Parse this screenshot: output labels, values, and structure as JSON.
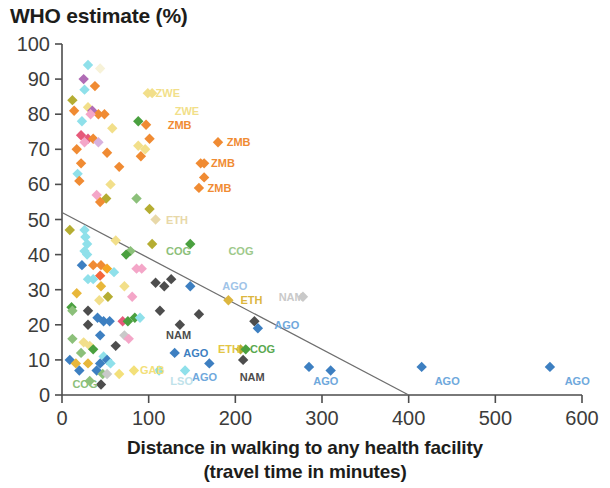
{
  "chart_data": {
    "type": "scatter",
    "title": "WHO estimate (%)",
    "ylabel": "WHO estimate (%)",
    "xlabel": "Distance in walking to any health facility",
    "xlabel_line2": "(travel time in minutes)",
    "xlim": [
      0,
      600
    ],
    "ylim": [
      0,
      100
    ],
    "xticks": [
      0,
      100,
      200,
      300,
      400,
      500,
      600
    ],
    "yticks": [
      0,
      10,
      20,
      30,
      40,
      50,
      60,
      70,
      80,
      90,
      100
    ],
    "grid": false,
    "legend": "none",
    "trendline": {
      "x0": 0,
      "y0": 52,
      "x1": 400,
      "y1": 0,
      "color": "#6e6e6e"
    },
    "annotations": [
      {
        "text": "ZWE",
        "x": 108,
        "y": 86,
        "color": "#f2df8a"
      },
      {
        "text": "ZWE",
        "x": 130,
        "y": 81,
        "color": "#f2df8a"
      },
      {
        "text": "ZMB",
        "x": 122,
        "y": 77,
        "color": "#f08b33"
      },
      {
        "text": "ZMB",
        "x": 190,
        "y": 72,
        "color": "#f08b33"
      },
      {
        "text": "ZMB",
        "x": 172,
        "y": 66,
        "color": "#f08b33"
      },
      {
        "text": "ZMB",
        "x": 168,
        "y": 59,
        "color": "#f08b33"
      },
      {
        "text": "ETH",
        "x": 120,
        "y": 50,
        "color": "#e8d8a8"
      },
      {
        "text": "COG",
        "x": 120,
        "y": 41,
        "color": "#8cc07a"
      },
      {
        "text": "COG",
        "x": 192,
        "y": 41,
        "color": "#9ec98b"
      },
      {
        "text": "AGO",
        "x": 185,
        "y": 31,
        "color": "#9fc4e8"
      },
      {
        "text": "ETH",
        "x": 206,
        "y": 27,
        "color": "#dcb63f"
      },
      {
        "text": "NAM",
        "x": 250,
        "y": 28,
        "color": "#c9c9c9"
      },
      {
        "text": "AGO",
        "x": 245,
        "y": 20,
        "color": "#6fa8dc"
      },
      {
        "text": "NAM",
        "x": 120,
        "y": 17,
        "color": "#4d4d4d"
      },
      {
        "text": "AGO",
        "x": 140,
        "y": 12,
        "color": "#3d7fc1"
      },
      {
        "text": "ETH",
        "x": 180,
        "y": 13,
        "color": "#e3c646"
      },
      {
        "text": "COG",
        "x": 217,
        "y": 13,
        "color": "#5aa84f"
      },
      {
        "text": "AGO",
        "x": 150,
        "y": 5,
        "color": "#6fa8dc"
      },
      {
        "text": "NAM",
        "x": 205,
        "y": 5,
        "color": "#4d4d4d"
      },
      {
        "text": "AGO",
        "x": 290,
        "y": 4,
        "color": "#6fa8dc"
      },
      {
        "text": "AGO",
        "x": 430,
        "y": 4,
        "color": "#6fa8dc"
      },
      {
        "text": "AGO",
        "x": 580,
        "y": 4,
        "color": "#6fa8dc"
      },
      {
        "text": "LSO",
        "x": 125,
        "y": 4,
        "color": "#bfe2ea"
      },
      {
        "text": "GAB",
        "x": 90,
        "y": 7,
        "color": "#f3e07a"
      },
      {
        "text": "COG",
        "x": 12,
        "y": 3,
        "color": "#8cc07a"
      }
    ],
    "points": [
      {
        "x": 30,
        "y": 94,
        "c": "#8fe0ea"
      },
      {
        "x": 44,
        "y": 93,
        "c": "#f7f2d8"
      },
      {
        "x": 25,
        "y": 90,
        "c": "#b06cb5"
      },
      {
        "x": 38,
        "y": 88,
        "c": "#f08b33"
      },
      {
        "x": 26,
        "y": 87,
        "c": "#8fe0ea"
      },
      {
        "x": 12,
        "y": 84,
        "c": "#b5ad32"
      },
      {
        "x": 99,
        "y": 86,
        "c": "#f2df8a"
      },
      {
        "x": 104,
        "y": 86,
        "c": "#f2df8a"
      },
      {
        "x": 14,
        "y": 81,
        "c": "#f08b33"
      },
      {
        "x": 30,
        "y": 82,
        "c": "#f2df8a"
      },
      {
        "x": 35,
        "y": 81,
        "c": "#b06cb5"
      },
      {
        "x": 42,
        "y": 80,
        "c": "#f08b33"
      },
      {
        "x": 49,
        "y": 80,
        "c": "#f08b33"
      },
      {
        "x": 33,
        "y": 80,
        "c": "#f4a6c8"
      },
      {
        "x": 23,
        "y": 78,
        "c": "#8fe0ea"
      },
      {
        "x": 88,
        "y": 78,
        "c": "#4aa03f"
      },
      {
        "x": 97,
        "y": 77,
        "c": "#f08b33"
      },
      {
        "x": 58,
        "y": 76,
        "c": "#f2df8a"
      },
      {
        "x": 22,
        "y": 74,
        "c": "#e65a7a"
      },
      {
        "x": 30,
        "y": 73,
        "c": "#e65a7a"
      },
      {
        "x": 36,
        "y": 73,
        "c": "#f08b33"
      },
      {
        "x": 26,
        "y": 72,
        "c": "#f4a6c8"
      },
      {
        "x": 42,
        "y": 72,
        "c": "#d8b2de"
      },
      {
        "x": 101,
        "y": 73,
        "c": "#f08b33"
      },
      {
        "x": 180,
        "y": 72,
        "c": "#f08b33"
      },
      {
        "x": 88,
        "y": 71,
        "c": "#f2df8a"
      },
      {
        "x": 96,
        "y": 70,
        "c": "#f2df8a"
      },
      {
        "x": 17,
        "y": 70,
        "c": "#f08b33"
      },
      {
        "x": 52,
        "y": 69,
        "c": "#f08b33"
      },
      {
        "x": 91,
        "y": 68,
        "c": "#f08b33"
      },
      {
        "x": 22,
        "y": 66,
        "c": "#f08b33"
      },
      {
        "x": 66,
        "y": 65,
        "c": "#f08b33"
      },
      {
        "x": 160,
        "y": 66,
        "c": "#f08b33"
      },
      {
        "x": 164,
        "y": 66,
        "c": "#f08b33"
      },
      {
        "x": 18,
        "y": 63,
        "c": "#8fe0ea"
      },
      {
        "x": 20,
        "y": 61,
        "c": "#f08b33"
      },
      {
        "x": 164,
        "y": 62,
        "c": "#f08b33"
      },
      {
        "x": 56,
        "y": 60,
        "c": "#f2df8a"
      },
      {
        "x": 158,
        "y": 59,
        "c": "#f08b33"
      },
      {
        "x": 40,
        "y": 57,
        "c": "#f4a6c8"
      },
      {
        "x": 51,
        "y": 56,
        "c": "#b5ad32"
      },
      {
        "x": 86,
        "y": 56,
        "c": "#8cc07a"
      },
      {
        "x": 44,
        "y": 55,
        "c": "#f08b33"
      },
      {
        "x": 101,
        "y": 53,
        "c": "#b5ad32"
      },
      {
        "x": 108,
        "y": 50,
        "c": "#e8d8a8"
      },
      {
        "x": 26,
        "y": 47,
        "c": "#8fe0ea"
      },
      {
        "x": 27,
        "y": 45,
        "c": "#8fe0ea"
      },
      {
        "x": 29,
        "y": 43,
        "c": "#8fe0ea"
      },
      {
        "x": 9,
        "y": 47,
        "c": "#b5ad32"
      },
      {
        "x": 62,
        "y": 44,
        "c": "#f2df8a"
      },
      {
        "x": 26,
        "y": 41,
        "c": "#8fe0ea"
      },
      {
        "x": 29,
        "y": 40,
        "c": "#8fe0ea"
      },
      {
        "x": 23,
        "y": 37,
        "c": "#3d7fc1"
      },
      {
        "x": 104,
        "y": 43,
        "c": "#b5ad32"
      },
      {
        "x": 148,
        "y": 43,
        "c": "#4aa03f"
      },
      {
        "x": 79,
        "y": 41,
        "c": "#8cc07a"
      },
      {
        "x": 74,
        "y": 40,
        "c": "#4aa03f"
      },
      {
        "x": 36,
        "y": 37,
        "c": "#f08b33"
      },
      {
        "x": 45,
        "y": 37,
        "c": "#f08b33"
      },
      {
        "x": 52,
        "y": 36,
        "c": "#f5a623"
      },
      {
        "x": 44,
        "y": 34,
        "c": "#f5673a"
      },
      {
        "x": 60,
        "y": 35,
        "c": "#8fe0ea"
      },
      {
        "x": 86,
        "y": 36,
        "c": "#f4a6c8"
      },
      {
        "x": 92,
        "y": 36,
        "c": "#f4a6c8"
      },
      {
        "x": 30,
        "y": 33,
        "c": "#8fe0ea"
      },
      {
        "x": 36,
        "y": 33,
        "c": "#8fe0ea"
      },
      {
        "x": 45,
        "y": 31,
        "c": "#e8b73a"
      },
      {
        "x": 72,
        "y": 31,
        "c": "#f2df8a"
      },
      {
        "x": 108,
        "y": 32,
        "c": "#4d4d4d"
      },
      {
        "x": 118,
        "y": 31,
        "c": "#4d4d4d"
      },
      {
        "x": 126,
        "y": 33,
        "c": "#4d4d4d"
      },
      {
        "x": 148,
        "y": 31,
        "c": "#3d7fc1"
      },
      {
        "x": 278,
        "y": 28,
        "c": "#c9c9c9"
      },
      {
        "x": 17,
        "y": 29,
        "c": "#e8b73a"
      },
      {
        "x": 53,
        "y": 28,
        "c": "#b5ad32"
      },
      {
        "x": 81,
        "y": 28,
        "c": "#f4a6c8"
      },
      {
        "x": 43,
        "y": 27,
        "c": "#f2df8a"
      },
      {
        "x": 192,
        "y": 27,
        "c": "#dcb63f"
      },
      {
        "x": 11,
        "y": 25,
        "c": "#4aa03f"
      },
      {
        "x": 12,
        "y": 24,
        "c": "#8cc07a"
      },
      {
        "x": 30,
        "y": 24,
        "c": "#4d4d4d"
      },
      {
        "x": 113,
        "y": 24,
        "c": "#4d4d4d"
      },
      {
        "x": 158,
        "y": 23,
        "c": "#4d4d4d"
      },
      {
        "x": 41,
        "y": 22,
        "c": "#3d7fc1"
      },
      {
        "x": 48,
        "y": 21,
        "c": "#3d7fc1"
      },
      {
        "x": 55,
        "y": 21,
        "c": "#3d7fc1"
      },
      {
        "x": 70,
        "y": 21,
        "c": "#e65a7a"
      },
      {
        "x": 76,
        "y": 21,
        "c": "#4aa03f"
      },
      {
        "x": 84,
        "y": 22,
        "c": "#4aa03f"
      },
      {
        "x": 90,
        "y": 22,
        "c": "#8fe0ea"
      },
      {
        "x": 30,
        "y": 20,
        "c": "#4d4d4d"
      },
      {
        "x": 136,
        "y": 20,
        "c": "#4d4d4d"
      },
      {
        "x": 222,
        "y": 21,
        "c": "#4d4d4d"
      },
      {
        "x": 226,
        "y": 19,
        "c": "#3d7fc1"
      },
      {
        "x": 12,
        "y": 16,
        "c": "#8cc07a"
      },
      {
        "x": 44,
        "y": 17,
        "c": "#3d7fc1"
      },
      {
        "x": 72,
        "y": 17,
        "c": "#c9c9c9"
      },
      {
        "x": 77,
        "y": 16,
        "c": "#f4a6c8"
      },
      {
        "x": 25,
        "y": 15,
        "c": "#f2df8a"
      },
      {
        "x": 32,
        "y": 14,
        "c": "#f2df8a"
      },
      {
        "x": 62,
        "y": 14,
        "c": "#4d4d4d"
      },
      {
        "x": 36,
        "y": 13,
        "c": "#4aa03f"
      },
      {
        "x": 22,
        "y": 12,
        "c": "#8cc07a"
      },
      {
        "x": 48,
        "y": 11,
        "c": "#8fe0ea"
      },
      {
        "x": 52,
        "y": 10,
        "c": "#3d7fc1"
      },
      {
        "x": 130,
        "y": 12,
        "c": "#3d7fc1"
      },
      {
        "x": 206,
        "y": 13,
        "c": "#b5ad32"
      },
      {
        "x": 212,
        "y": 13,
        "c": "#4aa03f"
      },
      {
        "x": 170,
        "y": 9,
        "c": "#3d7fc1"
      },
      {
        "x": 209,
        "y": 10,
        "c": "#4d4d4d"
      },
      {
        "x": 9,
        "y": 10,
        "c": "#3d7fc1"
      },
      {
        "x": 16,
        "y": 9,
        "c": "#e8b73a"
      },
      {
        "x": 30,
        "y": 9,
        "c": "#e8b73a"
      },
      {
        "x": 44,
        "y": 9,
        "c": "#3d7fc1"
      },
      {
        "x": 56,
        "y": 9,
        "c": "#8fe0ea"
      },
      {
        "x": 20,
        "y": 7,
        "c": "#3d7fc1"
      },
      {
        "x": 40,
        "y": 7,
        "c": "#3d7fc1"
      },
      {
        "x": 47,
        "y": 6,
        "c": "#8cc07a"
      },
      {
        "x": 52,
        "y": 6,
        "c": "#c9c9c9"
      },
      {
        "x": 66,
        "y": 6,
        "c": "#f3e07a"
      },
      {
        "x": 83,
        "y": 7,
        "c": "#f3e07a"
      },
      {
        "x": 112,
        "y": 7,
        "c": "#8fe0ea"
      },
      {
        "x": 142,
        "y": 7,
        "c": "#8fe0ea"
      },
      {
        "x": 32,
        "y": 4,
        "c": "#8cc07a"
      },
      {
        "x": 45,
        "y": 3,
        "c": "#4d4d4d"
      },
      {
        "x": 285,
        "y": 8,
        "c": "#3d7fc1"
      },
      {
        "x": 310,
        "y": 7,
        "c": "#3d7fc1"
      },
      {
        "x": 415,
        "y": 8,
        "c": "#3d7fc1"
      },
      {
        "x": 563,
        "y": 8,
        "c": "#3d7fc1"
      }
    ]
  }
}
